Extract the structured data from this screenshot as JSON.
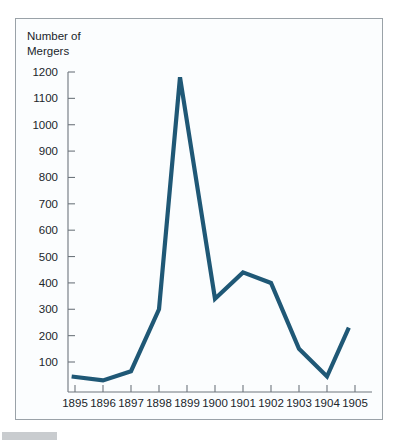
{
  "figure": {
    "background_color": "#fbfdfe",
    "frame_color": "#9aa2a8",
    "axis_color": "#6e767d",
    "line_color": "#1f5876",
    "footer_bar_color": "#c9cccf"
  },
  "chart_data": {
    "type": "line",
    "title": "",
    "ylabel_lines": [
      "Number of",
      "Mergers"
    ],
    "ylabel": "Number of Mergers",
    "xlabel": "",
    "categories": [
      1895,
      1896,
      1897,
      1898,
      1899,
      1900,
      1901,
      1902,
      1903,
      1904,
      1905
    ],
    "x_tick_labels": [
      "1895",
      "1896",
      "1897",
      "1898",
      "1899",
      "1900",
      "1901",
      "1902",
      "1903",
      "1904",
      "1905"
    ],
    "values": [
      45,
      30,
      65,
      300,
      1180,
      340,
      440,
      400,
      150,
      45,
      230
    ],
    "series": [
      {
        "name": "Number of Mergers",
        "values": [
          45,
          30,
          65,
          300,
          1180,
          340,
          440,
          400,
          150,
          45,
          230
        ]
      }
    ],
    "y_tick_labels": [
      "1200",
      "1100",
      "1000",
      "900",
      "800",
      "700",
      "600",
      "500",
      "400",
      "300",
      "200",
      "100"
    ],
    "y_ticks": [
      1200,
      1100,
      1000,
      900,
      800,
      700,
      600,
      500,
      400,
      300,
      200,
      100
    ],
    "ylim": [
      0,
      1200
    ],
    "xlim": [
      1895,
      1905
    ],
    "grid": false,
    "legend": false,
    "legend_position": "none",
    "marker": "none",
    "note_line_offsets": {
      "first_point_x_offset": -0.12,
      "peak_x_offset": -0.25,
      "last_point_x_offset": -0.22
    }
  }
}
